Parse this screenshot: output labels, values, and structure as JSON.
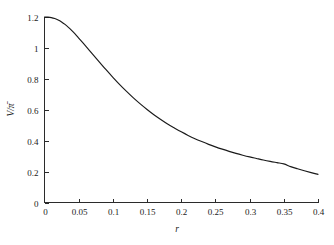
{
  "chart_data": {
    "type": "line",
    "title": "",
    "subtitle": "",
    "xlabel": "r",
    "ylabel": "V/π̄",
    "xlim": [
      0,
      0.4
    ],
    "ylim": [
      0,
      1.2
    ],
    "grid": false,
    "legend": null,
    "legend_position": "none",
    "xticks": [
      0,
      0.05,
      0.1,
      0.15,
      0.2,
      0.25,
      0.3,
      0.35,
      0.4
    ],
    "xtick_labels": [
      "0",
      "0.05",
      "0.1",
      "0.15",
      "0.2",
      "0.25",
      "0.3",
      "0.35",
      "0.4"
    ],
    "yticks": [
      0,
      0.2,
      0.4,
      0.6,
      0.8,
      1.0,
      1.2
    ],
    "ytick_labels": [
      "0",
      "0.2",
      "0.4",
      "0.6",
      "0.8",
      "1",
      "1.2"
    ],
    "series": [
      {
        "name": "V/π̄ vs r",
        "color": "#1a1a1a",
        "x": [
          0.0,
          0.005,
          0.01,
          0.015,
          0.02,
          0.025,
          0.03,
          0.035,
          0.04,
          0.045,
          0.05,
          0.06,
          0.07,
          0.08,
          0.09,
          0.1,
          0.11,
          0.12,
          0.13,
          0.14,
          0.15,
          0.16,
          0.17,
          0.18,
          0.19,
          0.2,
          0.21,
          0.22,
          0.23,
          0.24,
          0.25,
          0.26,
          0.27,
          0.28,
          0.29,
          0.3,
          0.31,
          0.32,
          0.33,
          0.34,
          0.35,
          0.36,
          0.37,
          0.38,
          0.39,
          0.4
        ],
        "y": [
          1.2,
          1.199,
          1.196,
          1.19,
          1.181,
          1.168,
          1.152,
          1.133,
          1.112,
          1.089,
          1.064,
          1.013,
          0.961,
          0.91,
          0.859,
          0.81,
          0.763,
          0.719,
          0.677,
          0.638,
          0.602,
          0.568,
          0.537,
          0.508,
          0.482,
          0.457,
          0.434,
          0.413,
          0.394,
          0.376,
          0.36,
          0.345,
          0.331,
          0.318,
          0.306,
          0.295,
          0.285,
          0.275,
          0.266,
          0.258,
          0.25,
          0.232,
          0.218,
          0.205,
          0.193,
          0.182
        ]
      }
    ]
  },
  "axes": {
    "x_title": "r",
    "y_title": "V/π̄"
  }
}
